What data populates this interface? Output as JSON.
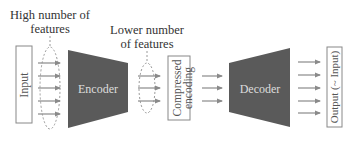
{
  "annotations": {
    "high_features_line1": "High number of",
    "high_features_line2": "features",
    "lower_features_line1": "Lower number",
    "lower_features_line2": "of features"
  },
  "blocks": {
    "input": "Input",
    "encoder": "Encoder",
    "compressed_line1": "Compressed",
    "compressed_line2": "encoding",
    "decoder": "Decoder",
    "output": "Output (~ Input)"
  },
  "colors": {
    "block_fill": "#5a5a5a",
    "arrow": "#8a8a8a",
    "box_stroke": "#888888",
    "text": "#333333",
    "block_text": "#dddddd",
    "ellipse": "#9a9a9a"
  },
  "arrow_counts": {
    "input_to_encoder": 5,
    "encoder_to_compressed": 3,
    "compressed_to_decoder": 3,
    "decoder_to_output": 5
  }
}
